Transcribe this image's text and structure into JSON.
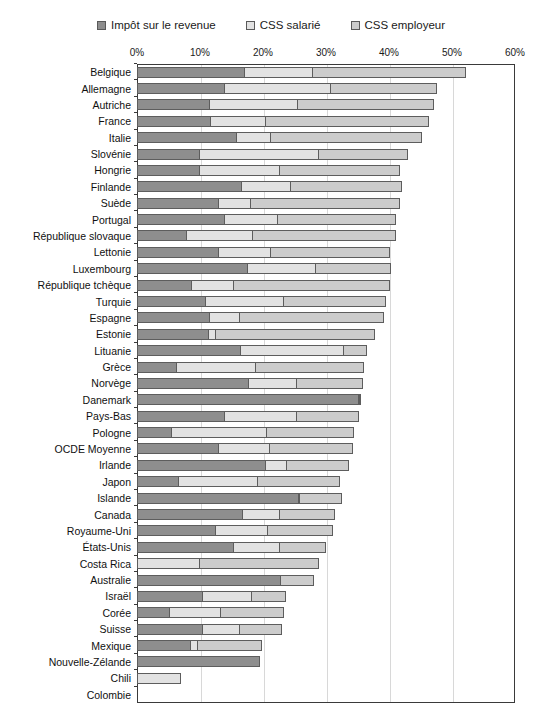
{
  "legend": {
    "items": [
      {
        "label": "Impôt sur le revenue",
        "color": "#8e8e8e",
        "name": "legend-income-tax"
      },
      {
        "label": "CSS salarié",
        "color": "#e2e2e2",
        "name": "legend-employee-ssc"
      },
      {
        "label": "CSS employeur",
        "color": "#cccccc",
        "name": "legend-employer-ssc"
      }
    ]
  },
  "chart_data": {
    "type": "bar",
    "orientation": "horizontal",
    "stacked": true,
    "title": "",
    "subtitle": "",
    "xlabel": "",
    "ylabel": "",
    "xlim": [
      0,
      60
    ],
    "xtick_labels": [
      "0%",
      "10%",
      "20%",
      "30%",
      "40%",
      "50%",
      "60%"
    ],
    "xticks": [
      0,
      10,
      20,
      30,
      40,
      50,
      60
    ],
    "grid": true,
    "legend_position": "top",
    "series": [
      {
        "name": "Impôt sur le revenue",
        "color": "#8e8e8e"
      },
      {
        "name": "CSS salarié",
        "color": "#e2e2e2"
      },
      {
        "name": "CSS employeur",
        "color": "#cccccc"
      }
    ],
    "categories": [
      "Belgique",
      "Allemagne",
      "Autriche",
      "France",
      "Italie",
      "Slovénie",
      "Hongrie",
      "Finlande",
      "Suède",
      "Portugal",
      "République slovaque",
      "Lettonie",
      "Luxembourg",
      "République tchèque",
      "Turquie",
      "Espagne",
      "Estonie",
      "Lituanie",
      "Grèce",
      "Norvège",
      "Danemark",
      "Pays-Bas",
      "Pologne",
      "OCDE Moyenne",
      "Irlande",
      "Japon",
      "Islande",
      "Canada",
      "Royaume-Uni",
      "États-Unis",
      "Costa Rica",
      "Australie",
      "Israël",
      "Corée",
      "Suisse",
      "Mexique",
      "Nouvelle-Zélande",
      "Chili",
      "Colombie"
    ],
    "values": [
      [
        17.1,
        11.0,
        24.4
      ],
      [
        14.0,
        17.0,
        17.0
      ],
      [
        11.6,
        14.1,
        21.8
      ],
      [
        11.8,
        8.8,
        26.0
      ],
      [
        15.8,
        5.7,
        24.0
      ],
      [
        10.0,
        19.0,
        14.3
      ],
      [
        10.0,
        12.8,
        19.2
      ],
      [
        16.6,
        8.0,
        17.8
      ],
      [
        13.0,
        5.3,
        23.7
      ],
      [
        14.0,
        8.5,
        19.0
      ],
      [
        8.0,
        10.5,
        23.0
      ],
      [
        13.0,
        8.5,
        19.0
      ],
      [
        17.6,
        11.0,
        12.0
      ],
      [
        8.8,
        6.8,
        24.8
      ],
      [
        11.0,
        12.5,
        16.3
      ],
      [
        11.6,
        4.9,
        23.0
      ],
      [
        11.5,
        1.2,
        25.4
      ],
      [
        16.5,
        16.5,
        3.8
      ],
      [
        6.4,
        12.7,
        17.3
      ],
      [
        17.8,
        7.8,
        10.6
      ],
      [
        35.3,
        0.1,
        0.1
      ],
      [
        14.0,
        11.5,
        10.0
      ],
      [
        5.5,
        15.3,
        14.0
      ],
      [
        13.0,
        8.2,
        13.4
      ],
      [
        20.4,
        3.6,
        9.9
      ],
      [
        6.7,
        12.6,
        13.2
      ],
      [
        25.7,
        0.4,
        6.7
      ],
      [
        16.8,
        6.0,
        9.0
      ],
      [
        12.5,
        8.5,
        10.5
      ],
      [
        15.4,
        7.5,
        7.4
      ],
      [
        0.0,
        10.0,
        19.0
      ],
      [
        22.8,
        0.0,
        5.5
      ],
      [
        10.5,
        7.9,
        5.6
      ],
      [
        5.3,
        8.2,
        10.2
      ],
      [
        10.5,
        6.0,
        6.8
      ],
      [
        8.5,
        1.3,
        10.3
      ],
      [
        19.6,
        0.0,
        0.0
      ],
      [
        0.0,
        7.0,
        0.0
      ],
      [
        0.0,
        0.0,
        0.0
      ]
    ]
  }
}
